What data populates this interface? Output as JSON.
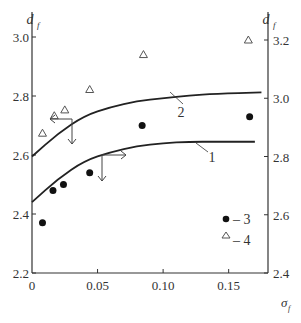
{
  "chart_data": {
    "type": "scatter",
    "title": "",
    "xlabel": "σf",
    "ylabel_left": "df",
    "ylabel_right": "df",
    "xlim": [
      0,
      0.18
    ],
    "ylim_left": [
      2.2,
      3.0
    ],
    "ylim_right": [
      2.4,
      3.2
    ],
    "x_ticks": [
      "0",
      "0.05",
      "0.10",
      "0.15"
    ],
    "x_tick_values": [
      0,
      0.05,
      0.1,
      0.15
    ],
    "y_left_ticks": [
      "2.2",
      "2.4",
      "2.6",
      "2.8",
      "3.0"
    ],
    "y_left_tick_values": [
      2.2,
      2.4,
      2.6,
      2.8,
      3.0
    ],
    "y_right_ticks": [
      "2.4",
      "2.6",
      "2.8",
      "3.0",
      "3.2"
    ],
    "y_right_tick_values": [
      2.4,
      2.6,
      2.8,
      3.0,
      3.2
    ],
    "grid": false,
    "legend_position": "lower right inside",
    "series": [
      {
        "name": "1",
        "kind": "curve",
        "axis": "left",
        "x": [
          0,
          0.02,
          0.04,
          0.06,
          0.08,
          0.1,
          0.12,
          0.14,
          0.17
        ],
        "y": [
          2.44,
          2.52,
          2.58,
          2.61,
          2.63,
          2.64,
          2.645,
          2.645,
          2.645
        ]
      },
      {
        "name": "2",
        "kind": "curve",
        "axis": "right",
        "x": [
          0,
          0.02,
          0.04,
          0.06,
          0.08,
          0.1,
          0.12,
          0.14,
          0.175
        ],
        "y": [
          2.8,
          2.88,
          2.94,
          2.97,
          2.99,
          3.0,
          3.01,
          3.015,
          3.02
        ]
      },
      {
        "name": "3",
        "kind": "points",
        "marker": "filled-circle",
        "axis": "left",
        "x": [
          0.008,
          0.016,
          0.024,
          0.044,
          0.084,
          0.166
        ],
        "y": [
          2.37,
          2.48,
          2.5,
          2.54,
          2.7,
          2.73
        ]
      },
      {
        "name": "4",
        "kind": "points",
        "marker": "open-triangle",
        "axis": "right",
        "x": [
          0.008,
          0.017,
          0.025,
          0.044,
          0.085,
          0.165
        ],
        "y": [
          2.88,
          2.94,
          2.96,
          3.03,
          3.15,
          3.2
        ]
      }
    ],
    "annotations": [
      {
        "text": "1",
        "target": "curve 1"
      },
      {
        "text": "2",
        "target": "curve 2"
      },
      {
        "text": "arrow-left-down",
        "target": "curve 2 → right axis marker (pointing left and down)"
      },
      {
        "text": "arrow-right-down",
        "target": "curve 1 → left axis marker (pointing right and down)"
      }
    ],
    "legend": [
      {
        "marker": "filled-circle",
        "label": "– 3"
      },
      {
        "marker": "open-triangle",
        "label": "– 4"
      }
    ]
  }
}
